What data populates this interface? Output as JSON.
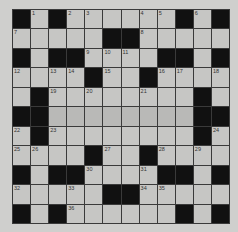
{
  "puzzle": {
    "type": "crossword",
    "rows": 12,
    "cols": 12,
    "grid": [
      [
        "#",
        "1",
        "#",
        "2",
        "3",
        ".",
        ".",
        "4",
        "5",
        "#",
        "6",
        "#"
      ],
      [
        "7",
        ".",
        ".",
        ".",
        ".",
        "#",
        "#",
        "8",
        ".",
        ".",
        ".",
        "."
      ],
      [
        "#",
        ".",
        "#",
        "#",
        "9",
        "10",
        "11",
        ".",
        "#",
        "#",
        ".",
        "#"
      ],
      [
        "12",
        ".",
        "13",
        "14",
        "#",
        "15",
        ".",
        "#",
        "16",
        "17",
        ".",
        "18"
      ],
      [
        ".",
        "#",
        "19",
        ".",
        "20",
        ".",
        ".",
        "21",
        ".",
        ".",
        "#",
        "."
      ],
      [
        "#",
        "#",
        ".",
        ".",
        ".",
        ".",
        ".",
        ".",
        ".",
        ".",
        "#",
        "#"
      ],
      [
        "22",
        "#",
        "23",
        ".",
        ".",
        ".",
        ".",
        ".",
        ".",
        ".",
        "#",
        "24"
      ],
      [
        "25",
        "26",
        ".",
        ".",
        "#",
        "27",
        ".",
        "#",
        "28",
        ".",
        "29",
        "."
      ],
      [
        "#",
        ".",
        "#",
        "#",
        "30",
        ".",
        ".",
        "31",
        "#",
        "#",
        ".",
        "#"
      ],
      [
        "32",
        ".",
        ".",
        "33",
        ".",
        "#",
        "#",
        "34",
        "35",
        ".",
        ".",
        "."
      ],
      [
        "#",
        ".",
        "#",
        "36",
        ".",
        ".",
        ".",
        ".",
        ".",
        "#",
        ".",
        "#"
      ],
      [
        ".",
        ".",
        ".",
        ".",
        ".",
        ".",
        ".",
        ".",
        ".",
        ".",
        ".",
        "."
      ]
    ],
    "shaded_rows": [
      5
    ],
    "colors": {
      "background": "#cfcfcd",
      "cell": "#c6c6c4",
      "black": "#111111",
      "gridline": "#3a3a3a"
    }
  }
}
